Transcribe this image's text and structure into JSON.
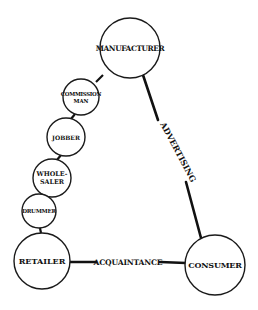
{
  "diagram": {
    "colors": {
      "ink": "#111111",
      "background": "#ffffff"
    },
    "nodes": {
      "manufacturer": {
        "label": "MANUFACTURER"
      },
      "retailer": {
        "label": "RETAILER"
      },
      "consumer": {
        "label": "CONSUMER"
      },
      "commission_man": {
        "line1": "COMMISSION",
        "line2": "MAN"
      },
      "jobber": {
        "label": "JOBBER"
      },
      "wholesaler": {
        "line1": "WHOLE-",
        "line2": "SALER"
      },
      "drummer": {
        "label": "DRUMMER"
      }
    },
    "edges": {
      "advertising": {
        "label": "ADVERTISING"
      },
      "acquaintance": {
        "label": "ACQUAINTANCE"
      }
    }
  }
}
